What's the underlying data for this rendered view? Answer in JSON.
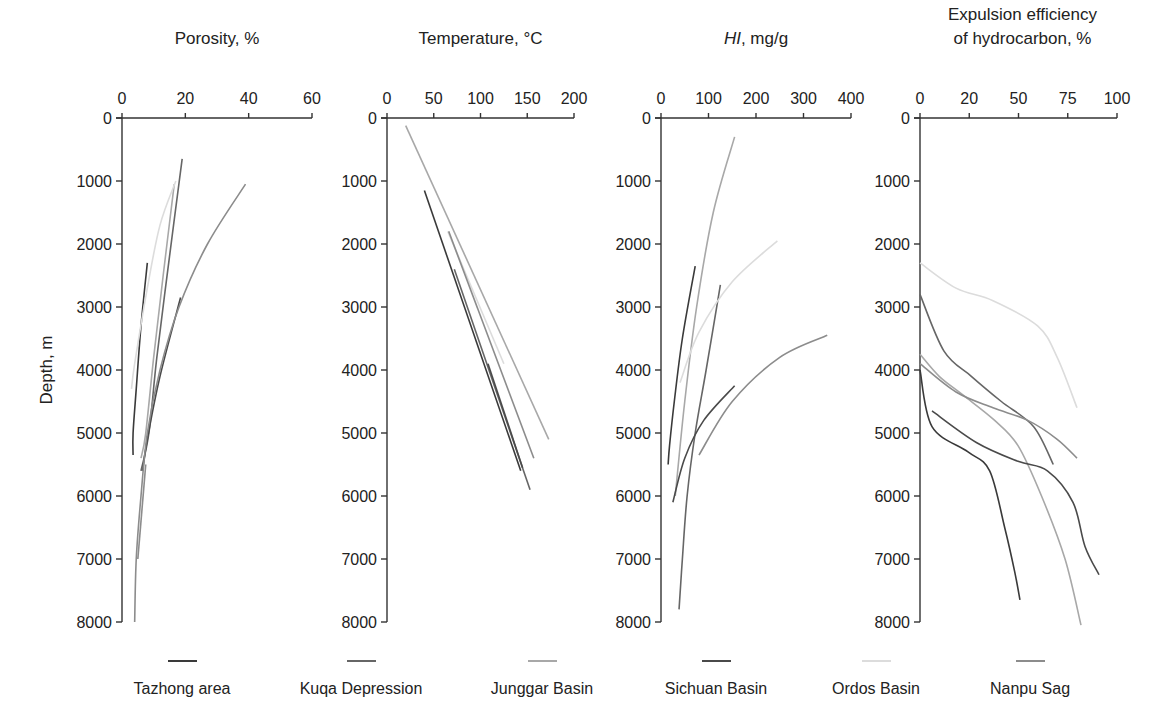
{
  "chart_data": [
    {
      "type": "line",
      "title": "Porosity, %",
      "xlabel": "Porosity, %",
      "ylabel": "Depth, m",
      "xlim": [
        0,
        60
      ],
      "ylim": [
        0,
        8000
      ],
      "y_inverted": true,
      "x_ticks": [
        "0",
        "20",
        "40",
        "60"
      ],
      "y_ticks": [
        "0",
        "1000",
        "2000",
        "3000",
        "4000",
        "5000",
        "6000",
        "7000",
        "8000"
      ],
      "series": [
        {
          "name": "Tazhong area",
          "points": [
            [
              8,
              2300
            ],
            [
              6,
              3300
            ],
            [
              4.5,
              4300
            ],
            [
              3.5,
              5000
            ],
            [
              3.5,
              5350
            ]
          ]
        },
        {
          "name": "Kuqa Depression",
          "points": [
            [
              19,
              650
            ],
            [
              15,
              2200
            ],
            [
              11,
              3800
            ],
            [
              8.5,
              5000
            ],
            [
              6,
              5600
            ]
          ]
        },
        {
          "name": "Junggar Basin",
          "points": [
            [
              16.5,
              1050
            ],
            [
              13,
              2500
            ],
            [
              10,
              3800
            ],
            [
              7.5,
              5000
            ],
            [
              6,
              5400
            ]
          ]
        },
        {
          "name": "Sichuan Basin",
          "points": [
            [
              18.5,
              2850
            ],
            [
              12,
              4100
            ],
            [
              8,
              5100
            ],
            [
              6.5,
              5600
            ]
          ]
        },
        {
          "name": "Ordos Basin",
          "points": [
            [
              17,
              1000
            ],
            [
              12,
              1700
            ],
            [
              8,
              2700
            ],
            [
              4,
              3900
            ],
            [
              3,
              4300
            ]
          ]
        },
        {
          "name": "Nanpu Sag",
          "points": [
            [
              39,
              1050
            ],
            [
              27,
              2000
            ],
            [
              18,
              3000
            ],
            [
              12,
              4000
            ],
            [
              8,
              5000
            ],
            [
              6,
              6000
            ],
            [
              4.5,
              7000
            ],
            [
              4,
              8000
            ]
          ]
        },
        {
          "name": "Nanpu Sag (short)",
          "points": [
            [
              7.5,
              5500
            ],
            [
              5,
              7000
            ]
          ]
        }
      ]
    },
    {
      "type": "line",
      "title": "Temperature, °C",
      "xlabel": "Temperature, °C",
      "ylabel": "Depth, m",
      "xlim": [
        0,
        200
      ],
      "ylim": [
        0,
        8000
      ],
      "y_inverted": true,
      "x_ticks": [
        "0",
        "50",
        "100",
        "150",
        "200"
      ],
      "y_ticks": [
        "0",
        "1000",
        "2000",
        "3000",
        "4000",
        "5000",
        "6000",
        "7000",
        "8000"
      ],
      "series": [
        {
          "name": "Tazhong area",
          "points": [
            [
              40,
              1150
            ],
            [
              143,
              5600
            ]
          ]
        },
        {
          "name": "Kuqa Depression",
          "points": [
            [
              72,
              2400
            ],
            [
              153,
              5900
            ]
          ]
        },
        {
          "name": "Junggar Basin",
          "points": [
            [
              20,
              120
            ],
            [
              173,
              5100
            ]
          ]
        },
        {
          "name": "Sichuan Basin",
          "points": [
            [
              108,
              3900
            ],
            [
              145,
              5550
            ]
          ]
        },
        {
          "name": "Ordos Basin",
          "points": [
            [
              65,
              1800
            ],
            [
              125,
              3900
            ]
          ]
        },
        {
          "name": "Nanpu Sag",
          "points": [
            [
              66,
              1800
            ],
            [
              157,
              5400
            ]
          ]
        }
      ]
    },
    {
      "type": "line",
      "title": "HI, mg/g",
      "xlabel": "HI, mg/g",
      "ylabel": "Depth, m",
      "xlim": [
        0,
        400
      ],
      "ylim": [
        0,
        8000
      ],
      "y_inverted": true,
      "x_ticks": [
        "0",
        "100",
        "200",
        "300",
        "400"
      ],
      "y_ticks": [
        "0",
        "1000",
        "2000",
        "3000",
        "4000",
        "5000",
        "6000",
        "7000",
        "8000"
      ],
      "series": [
        {
          "name": "Tazhong area",
          "points": [
            [
              72,
              2350
            ],
            [
              45,
              3500
            ],
            [
              28,
              4500
            ],
            [
              18,
              5200
            ],
            [
              15,
              5500
            ]
          ]
        },
        {
          "name": "Kuqa Depression",
          "points": [
            [
              125,
              2650
            ],
            [
              95,
              4000
            ],
            [
              72,
              5000
            ],
            [
              55,
              6000
            ],
            [
              45,
              7000
            ],
            [
              38,
              7800
            ]
          ]
        },
        {
          "name": "Junggar Basin",
          "points": [
            [
              155,
              300
            ],
            [
              110,
              1500
            ],
            [
              75,
              3000
            ],
            [
              50,
              4500
            ],
            [
              30,
              6000
            ]
          ]
        },
        {
          "name": "Sichuan Basin",
          "points": [
            [
              155,
              4250
            ],
            [
              90,
              4800
            ],
            [
              50,
              5400
            ],
            [
              25,
              6100
            ]
          ]
        },
        {
          "name": "Ordos Basin",
          "points": [
            [
              245,
              1950
            ],
            [
              150,
              2600
            ],
            [
              80,
              3400
            ],
            [
              40,
              4200
            ]
          ]
        },
        {
          "name": "Nanpu Sag",
          "points": [
            [
              350,
              3450
            ],
            [
              250,
              3800
            ],
            [
              150,
              4500
            ],
            [
              80,
              5350
            ]
          ]
        }
      ]
    },
    {
      "type": "line",
      "title": "Expulsion efficiency of hydrocarbon, %",
      "xlabel": "Expulsion efficiency of hydrocarbon, %",
      "ylabel": "Depth, m",
      "xlim": [
        0,
        100
      ],
      "ylim": [
        0,
        8000
      ],
      "y_inverted": true,
      "x_ticks": [
        "0",
        "20",
        "50",
        "75",
        "100"
      ],
      "y_ticks": [
        "0",
        "1000",
        "2000",
        "3000",
        "4000",
        "5000",
        "6000",
        "7000",
        "8000"
      ],
      "series": [
        {
          "name": "Tazhong area",
          "points": [
            [
              0,
              4000
            ],
            [
              5,
              4900
            ],
            [
              20,
              5300
            ],
            [
              33,
              5600
            ],
            [
              42,
              6500
            ],
            [
              48,
              7200
            ],
            [
              51,
              7650
            ]
          ]
        },
        {
          "name": "Kuqa Depression",
          "points": [
            [
              0,
              2800
            ],
            [
              10,
              3700
            ],
            [
              22,
              4100
            ],
            [
              40,
              4500
            ],
            [
              58,
              4900
            ],
            [
              68,
              5500
            ]
          ]
        },
        {
          "name": "Junggar Basin",
          "points": [
            [
              0,
              3750
            ],
            [
              8,
              4100
            ],
            [
              18,
              4400
            ],
            [
              36,
              4800
            ],
            [
              50,
              5200
            ],
            [
              62,
              6000
            ],
            [
              74,
              7000
            ],
            [
              82,
              8050
            ]
          ]
        },
        {
          "name": "Sichuan Basin",
          "points": [
            [
              5,
              4650
            ],
            [
              25,
              5150
            ],
            [
              50,
              5450
            ],
            [
              65,
              5600
            ],
            [
              78,
              6100
            ],
            [
              84,
              6800
            ],
            [
              91,
              7250
            ]
          ]
        },
        {
          "name": "Ordos Basin",
          "points": [
            [
              0,
              2300
            ],
            [
              15,
              2700
            ],
            [
              35,
              2900
            ],
            [
              60,
              3300
            ],
            [
              70,
              3800
            ],
            [
              80,
              4600
            ]
          ]
        },
        {
          "name": "Nanpu Sag",
          "points": [
            [
              0,
              3900
            ],
            [
              15,
              4350
            ],
            [
              35,
              4600
            ],
            [
              55,
              4800
            ],
            [
              70,
              5100
            ],
            [
              80,
              5400
            ]
          ]
        }
      ]
    }
  ],
  "panels": [
    {
      "title": "Porosity, %",
      "ticks": [
        "0",
        "20",
        "40",
        "60"
      ]
    },
    {
      "title": "Temperature, °C",
      "ticks": [
        "0",
        "50",
        "100",
        "150",
        "200"
      ]
    },
    {
      "title_italic": "HI",
      "title_rest": ", mg/g",
      "ticks": [
        "0",
        "100",
        "200",
        "300",
        "400"
      ]
    },
    {
      "title_line1": "Expulsion efficiency",
      "title_line2": "of hydrocarbon, %",
      "ticks": [
        "0",
        "20",
        "50",
        "75",
        "100"
      ]
    }
  ],
  "depth_ticks": [
    "0",
    "1000",
    "2000",
    "3000",
    "4000",
    "5000",
    "6000",
    "7000",
    "8000"
  ],
  "ylabel": "Depth, m",
  "legend": [
    {
      "label": "Tazhong area",
      "color": "#3a3a3a"
    },
    {
      "label": "Kuqa Depression",
      "color": "#666666"
    },
    {
      "label": "Junggar Basin",
      "color": "#a8a8a8"
    },
    {
      "label": "Sichuan Basin",
      "color": "#4a4a4a"
    },
    {
      "label": "Ordos Basin",
      "color": "#dcdcdc"
    },
    {
      "label": "Nanpu Sag",
      "color": "#8c8c8c"
    }
  ]
}
